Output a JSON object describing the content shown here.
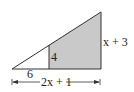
{
  "diagram": {
    "type": "similar-triangles",
    "colors": {
      "shade": "#c9c9c9",
      "stroke": "#333333",
      "background": "#ffffff"
    },
    "labels": {
      "small_height": "4",
      "small_base": "6",
      "large_base": "2x + 1",
      "large_height": "x + 3"
    }
  }
}
